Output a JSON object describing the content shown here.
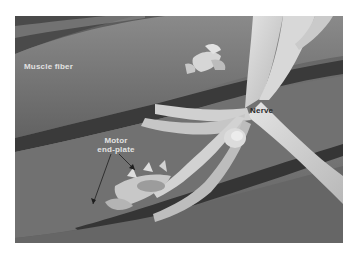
{
  "image": {
    "kind": "scanning electron micrograph",
    "colors": {
      "background": "#ffffff",
      "muscle_fiber": "#6e6e6e",
      "muscle_fiber_highlight": "#8c8c8c",
      "groove_shadow": "#2e2e2e",
      "nerve": "#cfcfcf",
      "nerve_highlight": "#e6e6e6"
    }
  },
  "labels": {
    "muscle_fiber": "Muscle fiber",
    "nerve": "Nerve",
    "motor_end_plate_line1": "Motor",
    "motor_end_plate_line2": "end-plate"
  }
}
